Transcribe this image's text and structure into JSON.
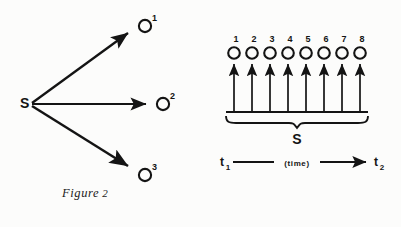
{
  "document": {
    "background_color": "#fcfcfb",
    "ink_color": "#141414"
  },
  "figure2": {
    "caption_word": "Figure",
    "caption_number": "2",
    "source_label": "S",
    "nodes": [
      {
        "label": "O",
        "superscript": "1"
      },
      {
        "label": "O",
        "superscript": "2"
      },
      {
        "label": "O",
        "superscript": "3"
      }
    ]
  },
  "figure3": {
    "caption_word": "Figure",
    "caption_number": "3",
    "brace_label": "S",
    "node_label": "O",
    "event_numbers": [
      "1",
      "2",
      "3",
      "4",
      "5",
      "6",
      "7",
      "8"
    ],
    "axis": {
      "start_label": "t",
      "start_subscript": "1",
      "end_label": "t",
      "end_subscript": "2",
      "middle_label": "(time)"
    }
  }
}
